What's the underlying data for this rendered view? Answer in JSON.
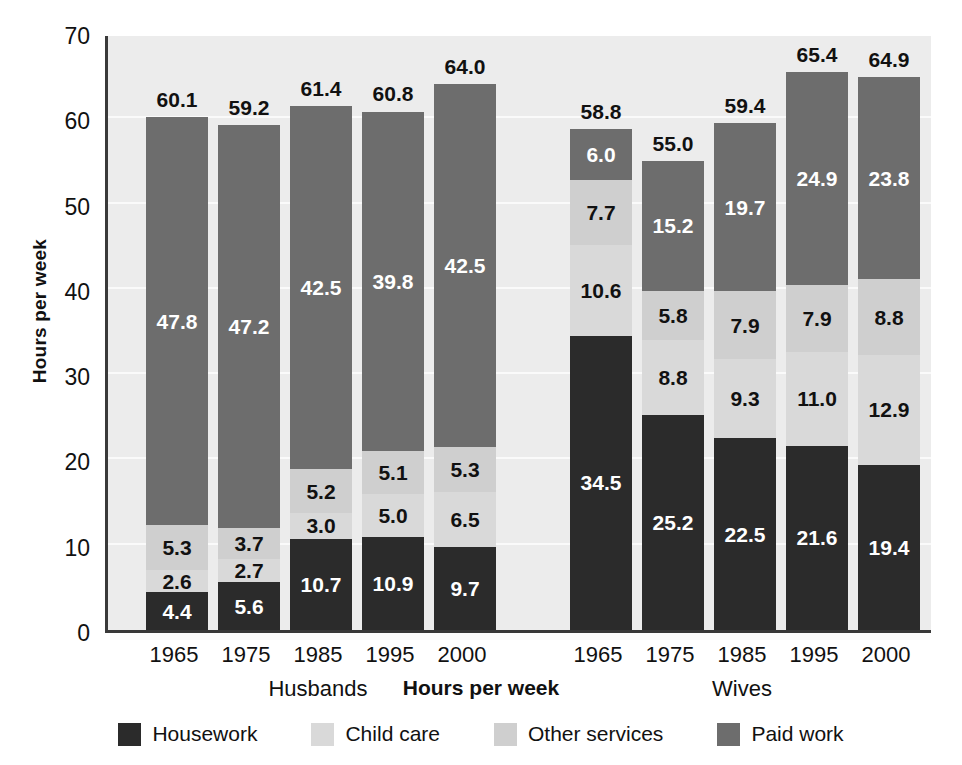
{
  "chart_data": {
    "type": "bar",
    "subtype": "stacked-bar",
    "title": "",
    "xlabel": "Hours per week",
    "ylabel": "Hours per week",
    "ylim": [
      0,
      70
    ],
    "yticks": [
      0,
      10,
      20,
      30,
      40,
      50,
      60,
      70
    ],
    "grid": true,
    "legend_position": "bottom",
    "categories": [
      "1965",
      "1975",
      "1985",
      "1995",
      "2000"
    ],
    "groups": [
      "Husbands",
      "Wives"
    ],
    "stack_order_bottom_to_top": [
      "Housework",
      "Child care",
      "Other services",
      "Paid work"
    ],
    "series": [
      {
        "name": "Housework",
        "color": "#2b2b2b",
        "label_color": "#ffffff",
        "values": {
          "Husbands": [
            4.4,
            5.6,
            10.7,
            10.9,
            9.7
          ],
          "Wives": [
            34.5,
            25.2,
            22.5,
            21.6,
            19.4
          ]
        }
      },
      {
        "name": "Child care",
        "color": "#d9d9d9",
        "label_color": "#111111",
        "values": {
          "Husbands": [
            2.6,
            2.7,
            3.0,
            5.0,
            6.5
          ],
          "Wives": [
            10.6,
            8.8,
            9.3,
            11.0,
            12.9
          ]
        }
      },
      {
        "name": "Other services",
        "color": "#cfcfcf",
        "label_color": "#111111",
        "values": {
          "Husbands": [
            5.3,
            3.7,
            5.2,
            5.1,
            5.3
          ],
          "Wives": [
            7.7,
            5.8,
            7.9,
            7.9,
            8.8
          ]
        }
      },
      {
        "name": "Paid work",
        "color": "#6d6d6d",
        "label_color": "#ffffff",
        "values": {
          "Husbands": [
            47.8,
            47.2,
            42.5,
            39.8,
            42.5
          ],
          "Wives": [
            6.0,
            15.2,
            19.7,
            24.9,
            23.8
          ]
        }
      }
    ],
    "totals": {
      "Husbands": [
        60.1,
        59.2,
        61.4,
        60.8,
        64.0
      ],
      "Wives": [
        58.8,
        55.0,
        59.4,
        65.4,
        64.9
      ]
    }
  },
  "axes": {
    "y_title": "Hours per week",
    "x_title": "Hours per week",
    "y_tick_labels": [
      "70",
      "60",
      "50",
      "40",
      "30",
      "20",
      "10",
      "0"
    ]
  },
  "group_labels": {
    "husbands": "Husbands",
    "wives": "Wives"
  },
  "x_tick_labels": {
    "husbands": [
      "1965",
      "1975",
      "1985",
      "1995",
      "2000"
    ],
    "wives": [
      "1965",
      "1975",
      "1985",
      "1995",
      "2000"
    ]
  },
  "legend": {
    "items": [
      {
        "label": "Housework",
        "color": "#2b2b2b"
      },
      {
        "label": "Child care",
        "color": "#d9d9d9"
      },
      {
        "label": "Other services",
        "color": "#cfcfcf"
      },
      {
        "label": "Paid work",
        "color": "#6d6d6d"
      }
    ]
  },
  "style": {
    "plot_background": "#ececec",
    "gridline_color": "#fafafa",
    "axis_color": "#3a3a3a",
    "page_background": "#ffffff"
  }
}
